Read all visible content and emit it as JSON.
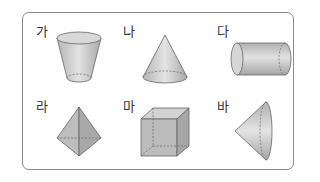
{
  "figure": {
    "items": [
      {
        "label": "가",
        "shape": "truncated-cone"
      },
      {
        "label": "나",
        "shape": "cone"
      },
      {
        "label": "다",
        "shape": "cylinder-horizontal"
      },
      {
        "label": "라",
        "shape": "triangular-bipyramid"
      },
      {
        "label": "마",
        "shape": "cube"
      },
      {
        "label": "바",
        "shape": "cone-sideways"
      }
    ]
  }
}
